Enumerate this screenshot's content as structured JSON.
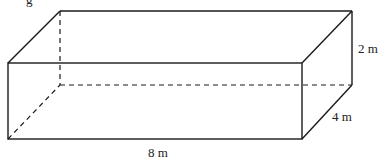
{
  "diagram": {
    "type": "rectangular-prism",
    "partial_top_text": "g",
    "dimensions": {
      "length_label": "8 m",
      "width_label": "4 m",
      "height_label": "2 m"
    },
    "colors": {
      "stroke": "#1a1a1a",
      "text": "#222222",
      "background": "#ffffff"
    }
  }
}
